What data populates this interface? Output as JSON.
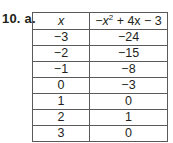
{
  "problem": {
    "label": "10. a."
  },
  "table": {
    "headers": {
      "x": "x",
      "fx": {
        "minus": "−",
        "var": "x",
        "exp": "2",
        "rest": " + 4x − 3"
      }
    },
    "rows": [
      {
        "x": "−3",
        "y": "−24"
      },
      {
        "x": "−2",
        "y": "−15"
      },
      {
        "x": "−1",
        "y": "−8"
      },
      {
        "x": "0",
        "y": "−3"
      },
      {
        "x": "1",
        "y": "0"
      },
      {
        "x": "2",
        "y": "1"
      },
      {
        "x": "3",
        "y": "0"
      }
    ]
  }
}
